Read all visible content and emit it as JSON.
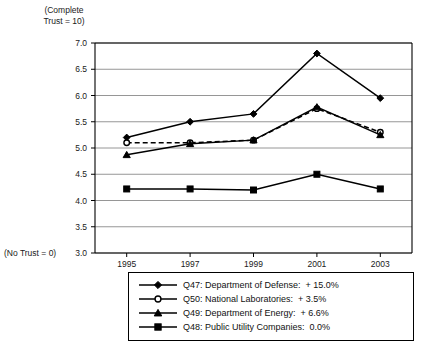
{
  "chart_data": {
    "type": "line",
    "title": "",
    "subtitle": "",
    "xlabel": "",
    "ylabel": "",
    "x": [
      1995,
      1997,
      1999,
      2001,
      2003
    ],
    "categories": [
      "1995",
      "1997",
      "1999",
      "2001",
      "2003"
    ],
    "ylim": [
      3.0,
      7.0
    ],
    "yticks": [
      3.0,
      3.5,
      4.0,
      4.5,
      5.0,
      5.5,
      6.0,
      6.5,
      7.0
    ],
    "ytick_labels": [
      "3.0",
      "3.5",
      "4.0",
      "4.5",
      "5.0",
      "5.5",
      "6.0",
      "6.5",
      "7.0"
    ],
    "grid": true,
    "grid_axis": "y",
    "legend_position": "below-center",
    "y_axis_top_note": "(Complete\nTrust = 10)",
    "y_axis_bottom_note": "(No Trust = 0)",
    "series": [
      {
        "name": "Q47: Department of Defense:  + 15.0%",
        "key": "Q47",
        "label": "Q47: Department of Defense:",
        "change": "+ 15.0%",
        "marker": "filled-diamond",
        "line_style": "solid",
        "color": "#000000",
        "values": [
          5.2,
          5.5,
          5.65,
          6.8,
          5.95
        ]
      },
      {
        "name": "Q50: National Laboratories:  + 3.5%",
        "key": "Q50",
        "label": "Q50: National Laboratories:",
        "change": "+ 3.5%",
        "marker": "open-circle",
        "line_style": "dashed",
        "color": "#000000",
        "values": [
          5.1,
          5.1,
          5.15,
          5.75,
          5.3
        ]
      },
      {
        "name": "Q49: Department of Energy:  + 6.6%",
        "key": "Q49",
        "label": "Q49: Department of Energy:",
        "change": "+ 6.6%",
        "marker": "filled-triangle",
        "line_style": "solid",
        "color": "#000000",
        "values": [
          4.87,
          5.08,
          5.15,
          5.78,
          5.25
        ]
      },
      {
        "name": "Q48: Public Utility Companies:  0.0%",
        "key": "Q48",
        "label": "Q48: Public Utility Companies:",
        "change": "0.0%",
        "marker": "filled-square",
        "line_style": "solid",
        "color": "#000000",
        "values": [
          4.22,
          4.22,
          4.2,
          4.5,
          4.22
        ]
      }
    ]
  },
  "legend": {
    "items": [
      {
        "text": "Q47: Department of Defense:  + 15.0%",
        "marker": "filled-diamond",
        "line_style": "solid"
      },
      {
        "text": "Q50: National Laboratories:  + 3.5%",
        "marker": "open-circle",
        "line_style": "solid"
      },
      {
        "text": "Q49: Department of Energy:  + 6.6%",
        "marker": "filled-triangle",
        "line_style": "solid"
      },
      {
        "text": "Q48: Public Utility Companies:  0.0%",
        "marker": "filled-square",
        "line_style": "solid"
      }
    ]
  }
}
